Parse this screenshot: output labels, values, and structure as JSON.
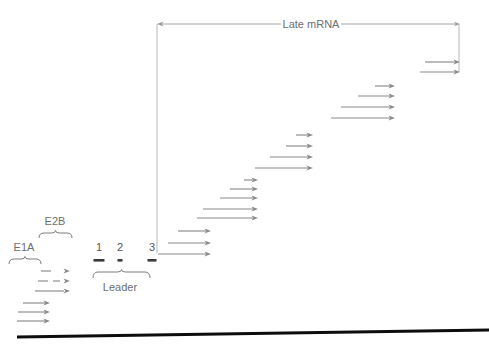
{
  "figure": {
    "title_label": "Late mRNA",
    "leader_label": "Leader",
    "e1a_label": "E1A",
    "e2b_label": "E2B",
    "colors": {
      "arrow": "#8a8a8a",
      "span_arrow": "#9a9a9a",
      "genome_line": "#0d0d0d",
      "text": "#6e6e6e",
      "leader_bar": "#3a3a3a",
      "vertical_line": "#b0b0b0"
    }
  },
  "span_arrow": {
    "name": "late-mrna-span",
    "label": "Late mRNA",
    "x1": 157,
    "x2": 460,
    "y": 24,
    "label_x": 311
  },
  "vertical_line": {
    "x": 157,
    "y1": 24,
    "y2": 253
  },
  "vertical_line_right": {
    "x": 459,
    "y1": 24,
    "y2": 72
  },
  "genome_line": {
    "x1": 17,
    "y1": 337,
    "x2": 489,
    "y2": 330,
    "width": 3
  },
  "leader": {
    "label": "Leader",
    "label_x": 120,
    "label_y": 288,
    "brace": {
      "x1": 93,
      "x2": 150,
      "y": 272,
      "depth": 6
    },
    "segments": [
      {
        "number": "1",
        "num_x": 99,
        "num_y": 248,
        "bar_x": 99,
        "bar_y": 259,
        "bar_w": 11,
        "bar_h": 2.6
      },
      {
        "number": "2",
        "num_x": 120,
        "num_y": 248,
        "bar_x": 120,
        "bar_y": 259,
        "bar_w": 5,
        "bar_h": 2.6
      },
      {
        "number": "3",
        "num_x": 152,
        "num_y": 248,
        "bar_x": 152,
        "bar_y": 259,
        "bar_w": 9,
        "bar_h": 2.6
      }
    ]
  },
  "e1a": {
    "label": "E1A",
    "label_x": 24,
    "label_y": 248,
    "brace": {
      "x1": 9,
      "x2": 41,
      "y": 259,
      "depth": 5
    },
    "arrows": [
      {
        "x1": 23,
        "x2": 50,
        "y": 303
      },
      {
        "x1": 18,
        "x2": 50,
        "y": 312
      },
      {
        "x1": 17,
        "x2": 50,
        "y": 321
      }
    ]
  },
  "e2b": {
    "label": "E2B",
    "label_x": 55,
    "label_y": 222,
    "brace": {
      "x1": 39,
      "x2": 72,
      "y": 233,
      "depth": 5
    },
    "arrows": [
      {
        "segments": [
          [
            41,
            51
          ]
        ],
        "tip_x": 70,
        "y": 271
      },
      {
        "segments": [
          [
            38,
            48
          ],
          [
            53,
            60
          ]
        ],
        "tip_x": 70,
        "y": 281
      },
      {
        "segments": [
          [
            35,
            64
          ]
        ],
        "tip_x": 70,
        "y": 291
      }
    ]
  },
  "mrna_groups": [
    {
      "name": "group-l1",
      "tip_x": 211,
      "arrows": [
        {
          "x1": 178,
          "y": 231
        },
        {
          "x1": 168,
          "y": 243
        },
        {
          "x1": 158,
          "y": 254
        }
      ]
    },
    {
      "name": "group-l2",
      "tip_x": 258,
      "arrows": [
        {
          "x1": 244,
          "y": 180
        },
        {
          "x1": 230,
          "y": 189
        },
        {
          "x1": 220,
          "y": 198
        },
        {
          "x1": 203,
          "y": 209
        },
        {
          "x1": 197,
          "y": 218
        }
      ]
    },
    {
      "name": "group-l3",
      "tip_x": 313,
      "arrows": [
        {
          "x1": 296,
          "y": 135
        },
        {
          "x1": 286,
          "y": 146
        },
        {
          "x1": 270,
          "y": 157
        },
        {
          "x1": 255,
          "y": 168
        }
      ]
    },
    {
      "name": "group-l4",
      "tip_x": 395,
      "arrows": [
        {
          "x1": 375,
          "y": 86
        },
        {
          "x1": 358,
          "y": 96
        },
        {
          "x1": 341,
          "y": 107
        },
        {
          "x1": 331,
          "y": 118
        }
      ]
    },
    {
      "name": "group-l5",
      "tip_x": 460,
      "arrows": [
        {
          "x1": 425,
          "y": 62
        },
        {
          "x1": 420,
          "y": 72
        }
      ]
    }
  ]
}
